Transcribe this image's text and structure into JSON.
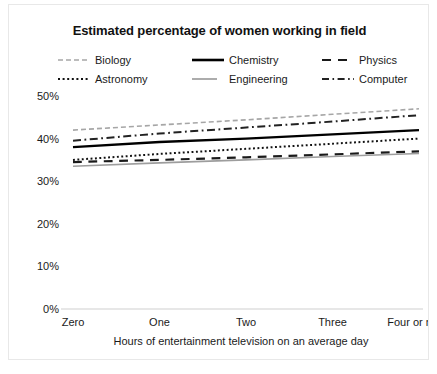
{
  "chart_data": {
    "type": "line",
    "title": "Estimated percentage of women working in field",
    "xlabel": "Hours of entertainment television on an average day",
    "ylabel": "",
    "categories": [
      "Zero",
      "One",
      "Two",
      "Three",
      "Four or more"
    ],
    "x": [
      0,
      1,
      2,
      3,
      4
    ],
    "ylim": [
      0,
      50
    ],
    "yticks": [
      0,
      10,
      20,
      30,
      40,
      50
    ],
    "ytick_labels": [
      "0%",
      "10%",
      "20%",
      "30%",
      "40%",
      "50%"
    ],
    "grid": false,
    "legend_position": "top",
    "legend_columns": 3,
    "series": [
      {
        "name": "Biology",
        "values": [
          42.0,
          43.2,
          44.4,
          45.7,
          47.0
        ],
        "color": "#a6a6a6",
        "dash": "dashed",
        "width": 1.6
      },
      {
        "name": "Chemistry",
        "values": [
          38.0,
          39.2,
          40.0,
          41.0,
          42.0
        ],
        "color": "#000000",
        "dash": "solid",
        "width": 2.4
      },
      {
        "name": "Physics",
        "values": [
          34.5,
          35.0,
          35.6,
          36.3,
          37.0
        ],
        "color": "#1a1a1a",
        "dash": "longdash",
        "width": 2.2
      },
      {
        "name": "Astronomy",
        "values": [
          35.0,
          36.4,
          37.6,
          38.8,
          40.0
        ],
        "color": "#111111",
        "dash": "dotted",
        "width": 2.0
      },
      {
        "name": "Engineering",
        "values": [
          33.5,
          34.3,
          35.0,
          35.8,
          36.5
        ],
        "color": "#9d9d9d",
        "dash": "solid",
        "width": 1.6
      },
      {
        "name": "Computer",
        "values": [
          39.5,
          41.2,
          42.6,
          44.0,
          45.5
        ],
        "color": "#222222",
        "dash": "dashdot",
        "width": 2.0
      }
    ]
  },
  "legend": {
    "items": [
      {
        "label": "Biology"
      },
      {
        "label": "Chemistry"
      },
      {
        "label": "Physics"
      },
      {
        "label": "Astronomy"
      },
      {
        "label": "Engineering"
      },
      {
        "label": "Computer"
      }
    ]
  },
  "axes": {
    "x_title": "Hours of entertainment television on an average day",
    "x_tick_labels": [
      "Zero",
      "One",
      "Two",
      "Three",
      "Four or more"
    ],
    "y_tick_labels": [
      "0%",
      "10%",
      "20%",
      "30%",
      "40%",
      "50%"
    ]
  },
  "colors": {
    "frame_border": "#e8e8e8",
    "axis_line": "#cfcfcf",
    "text": "#1a1a1a",
    "background": "#ffffff"
  }
}
